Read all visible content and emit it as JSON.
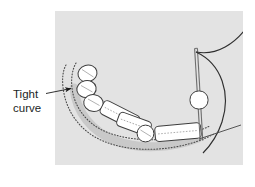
{
  "figure": {
    "kind": "technical-illustration",
    "caption_label": {
      "line1": "Tight",
      "line2": "curve",
      "full_text": "Tight curve",
      "color": "#221f1f"
    },
    "panel": {
      "background_color": "#e3e3e3",
      "x": 55,
      "y": 11,
      "width": 188,
      "height": 154
    },
    "colors": {
      "ink": "#3a3a3a",
      "body_fill": "#ffffff",
      "dotted_track": "#4a4a4a",
      "shadow": "#9a9a9a"
    },
    "elements": {
      "annotation_arrow": "leader-arrow-pointing-to-tight-curve",
      "track": "pair-of-dotted-curved-rails",
      "train_cars": [
        {
          "name": "car-1",
          "shape": "circle"
        },
        {
          "name": "car-2",
          "shape": "circle"
        },
        {
          "name": "car-3",
          "shape": "circle"
        },
        {
          "name": "car-4",
          "shape": "rounded-rectangle"
        },
        {
          "name": "car-5",
          "shape": "rounded-rectangle"
        },
        {
          "name": "car-6",
          "shape": "circle"
        },
        {
          "name": "car-7",
          "shape": "rounded-rectangle"
        }
      ],
      "vertical_post": "vertical-rail-post-with-disc",
      "post_disc": "white-disc-on-post",
      "right_curves": "two-sweeping-curves",
      "right_straight": "diagonal-straight-line"
    }
  }
}
